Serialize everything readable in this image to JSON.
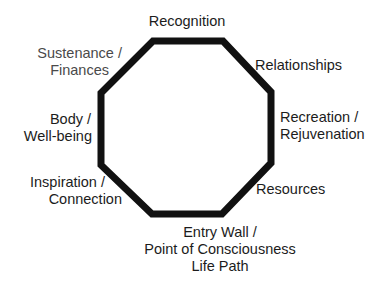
{
  "diagram": {
    "shape": "octagon",
    "stroke_color": "#111111",
    "stroke_width": 7,
    "vertices": [
      [
        153,
        41
      ],
      [
        223,
        41
      ],
      [
        271,
        92
      ],
      [
        271,
        163
      ],
      [
        222,
        214
      ],
      [
        152,
        214
      ],
      [
        101,
        165
      ],
      [
        101,
        93
      ]
    ],
    "labels": {
      "recognition": {
        "lines": [
          "Recognition"
        ],
        "position": "top"
      },
      "relationships": {
        "lines": [
          "Relationships"
        ],
        "position": "top-right"
      },
      "recreation": {
        "lines": [
          "Recreation /",
          "Rejuvenation"
        ],
        "position": "right"
      },
      "resources": {
        "lines": [
          "Resources"
        ],
        "position": "bottom-right"
      },
      "entry": {
        "lines": [
          "Entry Wall /",
          "Point of Consciousness",
          "Life Path"
        ],
        "position": "bottom"
      },
      "inspiration": {
        "lines": [
          "Inspiration /",
          "Connection"
        ],
        "position": "bottom-left"
      },
      "body": {
        "lines": [
          "Body /",
          "Well-being"
        ],
        "position": "left"
      },
      "sustenance": {
        "lines": [
          "Sustenance /",
          "Finances"
        ],
        "position": "top-left",
        "color": "#4a4a4a"
      }
    }
  }
}
